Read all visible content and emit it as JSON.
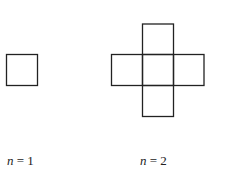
{
  "figures": [
    {
      "id": "n1",
      "label_var": "n",
      "label_eq": " = ",
      "label_val": "1",
      "squares": [
        [
          6,
          54
        ]
      ]
    },
    {
      "id": "n2",
      "label_var": "n",
      "label_eq": " = ",
      "label_val": "2",
      "squares": [
        [
          142,
          24
        ],
        [
          111,
          54
        ],
        [
          142,
          54
        ],
        [
          173,
          54
        ],
        [
          142,
          85
        ]
      ]
    }
  ],
  "square_size": 31,
  "stroke_color": "#222222"
}
